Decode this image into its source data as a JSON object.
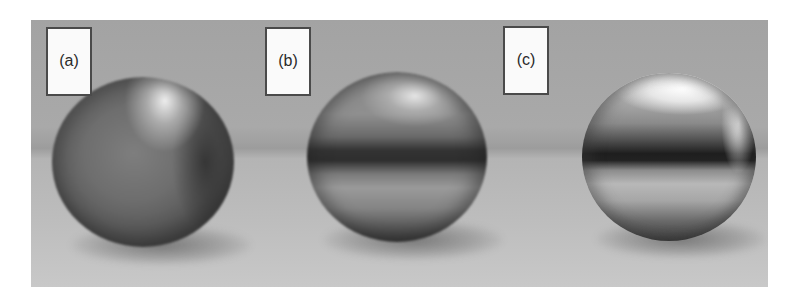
{
  "figure": {
    "panels": [
      {
        "label": "(a)",
        "description": "matte metal sphere"
      },
      {
        "label": "(b)",
        "description": "semi-glossy metal sphere"
      },
      {
        "label": "(c)",
        "description": "mirror-polished metal sphere"
      }
    ],
    "colors": {
      "background_upper": "#a8a8a8",
      "background_lower": "#bdbdbd",
      "label_fill": "#fafafa",
      "label_border": "#4a4a4a"
    }
  }
}
